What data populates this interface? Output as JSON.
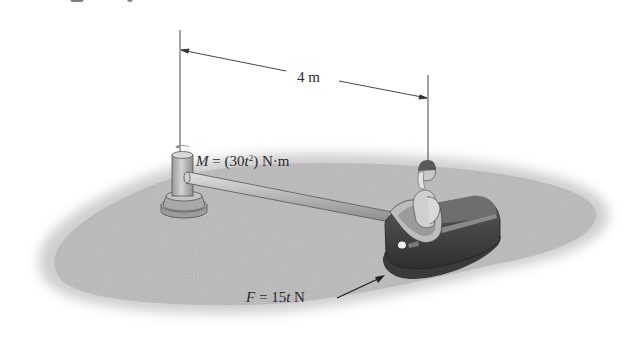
{
  "figure": {
    "dimension": {
      "label": "4 m",
      "value": 4,
      "unit": "m"
    },
    "moment": {
      "symbol": "M",
      "expression": "(30t²) N·m",
      "full_label": "M = (30t²) N·m"
    },
    "force": {
      "symbol": "F",
      "expression": "15t N",
      "full_label": "F = 15t N"
    },
    "colors": {
      "ground": "#c4c4c4",
      "ground_edge": "#dcdcdc",
      "rod": "#b8b8b8",
      "post": "#bdbdbd",
      "car_body": "#3d3d3d",
      "car_trim": "#8a8a8a",
      "line": "#333333"
    }
  }
}
